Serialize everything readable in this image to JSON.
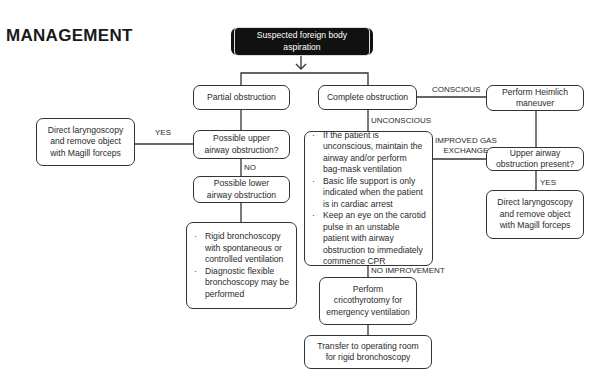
{
  "page": {
    "clipped_top_text": "",
    "heading": "MANAGEMENT"
  },
  "flowchart": {
    "start": "Suspected foreign body aspiration",
    "partial": "Partial obstruction",
    "complete": "Complete obstruction",
    "upper_q": [
      "Possible upper",
      "airway obstruction?"
    ],
    "direct_left": [
      "Direct laryngoscopy",
      "and remove object",
      "with Magill forceps"
    ],
    "lower": [
      "Possible lower",
      "airway obstruction"
    ],
    "rigid_list": [
      "Rigid bronchoscopy with spontaneous or controlled ventilation",
      "Diagnostic flexible bronchoscopy may be performed"
    ],
    "unconscious_list": [
      "If the patient is unconscious, maintain the airway and/or perform bag-mask ventilation",
      "Basic life support is only indicated when the patient is in cardiac arrest",
      "Keep an eye on the carotid pulse in an unstable patient with airway obstruction to immediately commence CPR"
    ],
    "heimlich": [
      "Perform Heimlich",
      "maneuver"
    ],
    "upper_present": [
      "Upper airway",
      "obstruction present?"
    ],
    "direct_right": [
      "Direct laryngoscopy",
      "and remove object",
      "with Magill forceps"
    ],
    "cricothyrotomy": [
      "Perform",
      "cricothyrotomy for",
      "emergency ventilation"
    ],
    "transfer": [
      "Transfer to operating room",
      "for rigid bronchoscopy"
    ],
    "labels": {
      "yes_left": "YES",
      "no": "NO",
      "conscious": "CONSCIOUS",
      "unconscious": "UNCONSCIOUS",
      "improved": [
        "IMPROVED GAS",
        "EXCHANGE"
      ],
      "yes_right": "YES",
      "no_improvement": "NO IMPROVEMENT"
    }
  }
}
